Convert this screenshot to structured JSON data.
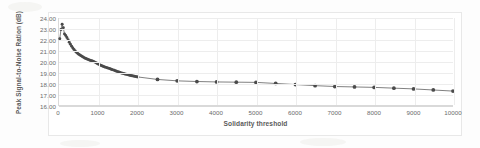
{
  "figure": {
    "background_color": "#ffffff",
    "frame_color": "#e8e8e8",
    "axis_color": "#d9d9d9",
    "grid_color": "#ededed",
    "tick_label_color": "#6b6b6b",
    "axis_title_color": "#5a5a5a"
  },
  "chart_data": {
    "type": "line",
    "title": "",
    "subtitle": "",
    "xlabel": "Solidarity threshold",
    "ylabel": "Peak Signal-to-Noise Ration (dB)",
    "xlim": [
      0,
      10000
    ],
    "ylim": [
      16.0,
      24.0
    ],
    "xticks": [
      0,
      1000,
      2000,
      3000,
      4000,
      5000,
      6000,
      7000,
      8000,
      9000,
      10000
    ],
    "xtick_labels": [
      "0",
      "1000",
      "2000",
      "3000",
      "4000",
      "5000",
      "6000",
      "7000",
      "8000",
      "9000",
      "10000"
    ],
    "yticks": [
      16.0,
      17.0,
      18.0,
      19.0,
      20.0,
      21.0,
      22.0,
      23.0,
      24.0
    ],
    "ytick_labels": [
      "16.00",
      "17.00",
      "18.00",
      "19.00",
      "20.00",
      "21.00",
      "22.00",
      "23.00",
      "24.00"
    ],
    "grid": true,
    "legend": false,
    "legend_position": "none",
    "marker": "circle",
    "marker_color": "#4a4a4a",
    "line_color": "#707070",
    "series": [
      {
        "name": "Peak Signal-to-Noise Ration (dB)",
        "x": [
          20,
          50,
          80,
          110,
          140,
          170,
          200,
          230,
          260,
          290,
          320,
          350,
          380,
          410,
          440,
          470,
          500,
          530,
          560,
          590,
          620,
          650,
          680,
          710,
          740,
          770,
          800,
          830,
          860,
          890,
          920,
          950,
          980,
          1010,
          1040,
          1070,
          1100,
          1130,
          1160,
          1190,
          1220,
          1250,
          1280,
          1310,
          1340,
          1370,
          1400,
          1430,
          1460,
          1490,
          1520,
          1550,
          1580,
          1610,
          1640,
          1670,
          1700,
          1730,
          1760,
          1790,
          1820,
          1850,
          1880,
          1910,
          1940,
          1970,
          2000,
          2500,
          3000,
          3500,
          4000,
          4500,
          5000,
          5500,
          6000,
          6500,
          7000,
          7500,
          8000,
          8500,
          9000,
          9500,
          10000
        ],
        "y": [
          22.1,
          22.95,
          23.42,
          23.1,
          22.52,
          22.4,
          22.2,
          22.0,
          21.78,
          21.58,
          21.4,
          21.24,
          21.1,
          20.97,
          20.86,
          20.76,
          20.67,
          20.59,
          20.52,
          20.45,
          20.39,
          20.33,
          20.28,
          20.23,
          20.19,
          20.14,
          20.1,
          20.06,
          20.02,
          19.97,
          19.92,
          19.86,
          19.8,
          19.74,
          19.68,
          19.63,
          19.58,
          19.54,
          19.5,
          19.46,
          19.42,
          19.39,
          19.35,
          19.31,
          19.27,
          19.23,
          19.19,
          19.15,
          19.11,
          19.07,
          19.03,
          18.99,
          18.95,
          18.92,
          18.89,
          18.86,
          18.83,
          18.8,
          18.77,
          18.74,
          18.71,
          18.68,
          18.66,
          18.64,
          18.62,
          18.6,
          18.58,
          18.35,
          18.22,
          18.16,
          18.12,
          18.1,
          18.08,
          17.98,
          17.88,
          17.78,
          17.7,
          17.66,
          17.62,
          17.55,
          17.48,
          17.38,
          17.28
        ],
        "dense_point_count": 67,
        "sparse_point_count": 16
      }
    ]
  }
}
